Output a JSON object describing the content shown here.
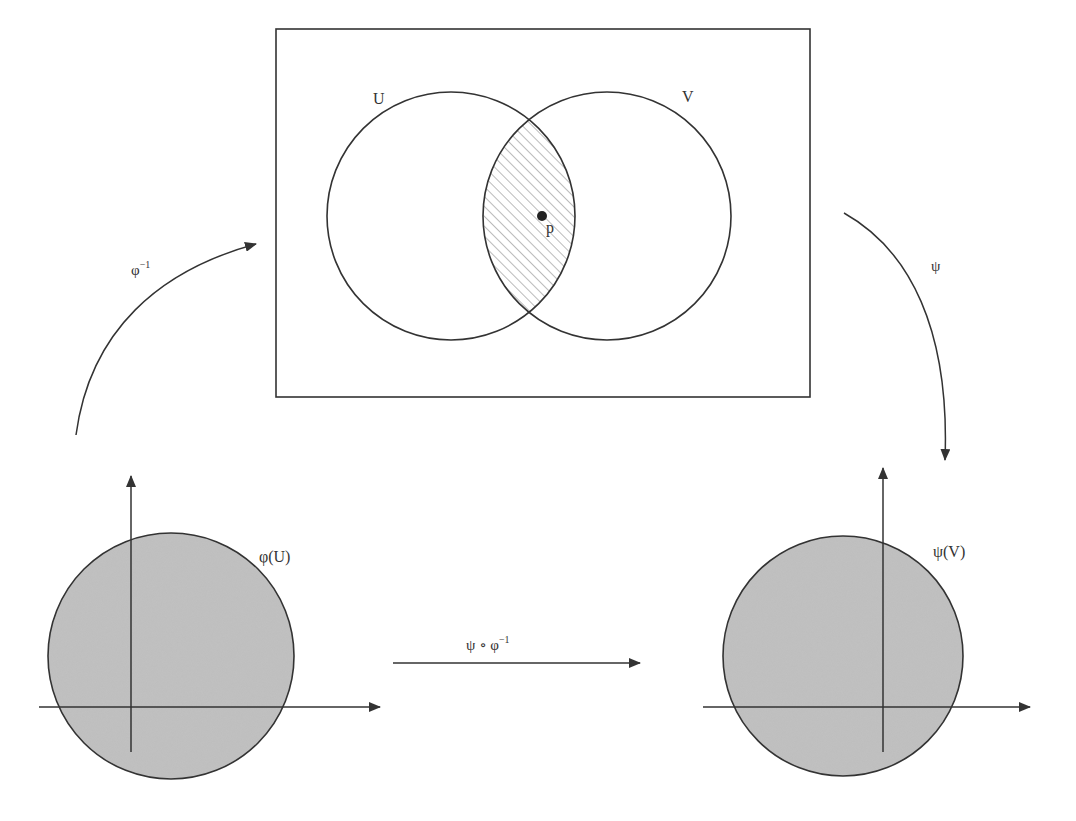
{
  "diagram": {
    "type": "manifold-chart-transition",
    "manifold_box": {
      "x": 276,
      "y": 29,
      "w": 534,
      "h": 368
    },
    "sets": [
      {
        "id": "U",
        "label": "U",
        "cx": 451,
        "cy": 216,
        "r": 124
      },
      {
        "id": "V",
        "label": "V",
        "cx": 607,
        "cy": 216,
        "r": 124
      }
    ],
    "intersection": {
      "label": "U ∩ V",
      "hatched": true
    },
    "point": {
      "label": "p",
      "cx": 542,
      "cy": 216
    },
    "labels": {
      "U": "U",
      "V": "V",
      "p": "p",
      "phi_inv": "φ",
      "phi_inv_sup": "−1",
      "psi": "ψ",
      "phi_U": "φ(U)",
      "psi_V": "ψ(V)",
      "transition": "ψ ∘ φ",
      "transition_sup": "−1"
    },
    "charts": [
      {
        "id": "phi-U",
        "label": "φ(U)",
        "disk_cx": 171,
        "disk_cy": 656,
        "disk_r": 123,
        "origin_x": 131,
        "origin_y": 707
      },
      {
        "id": "psi-V",
        "label": "ψ(V)",
        "disk_cx": 843,
        "disk_cy": 656,
        "disk_r": 120,
        "origin_x": 883,
        "origin_y": 707
      }
    ],
    "arrows": [
      {
        "id": "phi-inverse",
        "label": "φ⁻¹",
        "from": "φ(U)",
        "to": "M"
      },
      {
        "id": "psi",
        "label": "ψ",
        "from": "M",
        "to": "ψ(V)"
      },
      {
        "id": "transition-map",
        "label": "ψ ∘ φ⁻¹",
        "from": "φ(U)",
        "to": "ψ(V)"
      }
    ],
    "colors": {
      "stroke": "#333333",
      "disk_fill": "#bdbdbd",
      "hatch": "#777777",
      "background": "#ffffff"
    }
  }
}
